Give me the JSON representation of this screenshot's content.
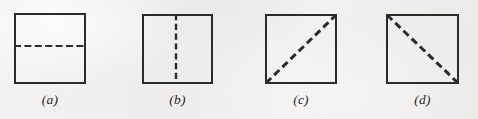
{
  "figure": {
    "background_color": "#f1f0ee",
    "ink_color": "#2b2b2b",
    "width": 478,
    "height": 119,
    "panels": [
      {
        "id": "a",
        "label": "(a)",
        "shape": "square",
        "cut": "horizontal-midline",
        "cut_style": "dashed",
        "square": {
          "x": 14,
          "y": 13,
          "width": 72,
          "height": 71
        },
        "line": {
          "x1": 14,
          "y1": 46,
          "x2": 86,
          "y2": 46
        },
        "label_pos": {
          "x": 14,
          "y": 92,
          "width": 72
        }
      },
      {
        "id": "b",
        "label": "(b)",
        "shape": "square",
        "cut": "vertical-midline",
        "cut_style": "dashed",
        "square": {
          "x": 142,
          "y": 14,
          "width": 71,
          "height": 70
        },
        "line": {
          "x1": 176,
          "y1": 14,
          "x2": 176,
          "y2": 84
        },
        "label_pos": {
          "x": 142,
          "y": 92,
          "width": 71
        }
      },
      {
        "id": "c",
        "label": "(c)",
        "shape": "square",
        "cut": "diagonal-bottomleft-to-topright",
        "cut_style": "dashed",
        "square": {
          "x": 265,
          "y": 14,
          "width": 72,
          "height": 70
        },
        "line": {
          "x1": 266,
          "y1": 83,
          "x2": 336,
          "y2": 15
        },
        "label_pos": {
          "x": 265,
          "y": 92,
          "width": 72
        }
      },
      {
        "id": "d",
        "label": "(d)",
        "shape": "square",
        "cut": "diagonal-topleft-to-bottomright",
        "cut_style": "dashed",
        "square": {
          "x": 386,
          "y": 14,
          "width": 73,
          "height": 70
        },
        "line": {
          "x1": 387,
          "y1": 15,
          "x2": 458,
          "y2": 83
        },
        "label_pos": {
          "x": 386,
          "y": 92,
          "width": 73
        }
      }
    ]
  }
}
